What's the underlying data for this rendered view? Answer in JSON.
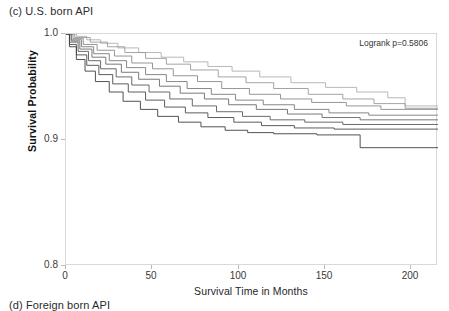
{
  "panel": {
    "title": "(c) U.S. born API",
    "next_panel_title": "(d) Foreign born API"
  },
  "chart_data": {
    "type": "line",
    "subtype": "kaplan-meier-step",
    "title": "(c) U.S. born API",
    "xlabel": "Survival Time in Months",
    "ylabel": "Survival Probability",
    "xlim": [
      0,
      215
    ],
    "ylim": [
      0.8,
      1.0
    ],
    "xticks": [
      0,
      50,
      100,
      150,
      200
    ],
    "xtick_labels": [
      "0",
      "50",
      "100",
      "150",
      "200"
    ],
    "yticks": [
      0.8,
      0.9,
      1.0
    ],
    "ytick_labels": [
      "0.8",
      "0.9",
      "1.0"
    ],
    "grid": false,
    "legend": "none",
    "annotations": [
      {
        "name": "logrank-annotation",
        "text": "Logrank p=0.5806",
        "position": "top-right"
      }
    ],
    "series": [
      {
        "name": "stage-group-1",
        "color": "#b0b0b0",
        "points": [
          [
            0,
            1.0
          ],
          [
            6,
            0.998
          ],
          [
            12,
            0.995
          ],
          [
            20,
            0.992
          ],
          [
            30,
            0.988
          ],
          [
            42,
            0.984
          ],
          [
            55,
            0.98
          ],
          [
            68,
            0.976
          ],
          [
            82,
            0.972
          ],
          [
            96,
            0.968
          ],
          [
            112,
            0.963
          ],
          [
            130,
            0.958
          ],
          [
            150,
            0.954
          ],
          [
            168,
            0.95
          ],
          [
            186,
            0.945
          ],
          [
            196,
            0.938
          ],
          [
            205,
            0.938
          ],
          [
            215,
            0.938
          ]
        ]
      },
      {
        "name": "stage-group-2",
        "color": "#9a9a9a",
        "points": [
          [
            0,
            1.0
          ],
          [
            5,
            0.997
          ],
          [
            14,
            0.993
          ],
          [
            24,
            0.989
          ],
          [
            34,
            0.984
          ],
          [
            46,
            0.979
          ],
          [
            58,
            0.974
          ],
          [
            72,
            0.969
          ],
          [
            88,
            0.963
          ],
          [
            104,
            0.958
          ],
          [
            120,
            0.953
          ],
          [
            140,
            0.948
          ],
          [
            160,
            0.944
          ],
          [
            178,
            0.94
          ],
          [
            196,
            0.936
          ],
          [
            215,
            0.936
          ]
        ]
      },
      {
        "name": "stage-group-3",
        "color": "#8a8a8a",
        "points": [
          [
            0,
            1.0
          ],
          [
            4,
            0.996
          ],
          [
            10,
            0.991
          ],
          [
            18,
            0.986
          ],
          [
            28,
            0.981
          ],
          [
            38,
            0.975
          ],
          [
            50,
            0.97
          ],
          [
            62,
            0.964
          ],
          [
            76,
            0.959
          ],
          [
            90,
            0.953
          ],
          [
            106,
            0.948
          ],
          [
            124,
            0.944
          ],
          [
            142,
            0.941
          ],
          [
            162,
            0.938
          ],
          [
            182,
            0.935
          ],
          [
            215,
            0.935
          ]
        ]
      },
      {
        "name": "stage-group-4",
        "color": "#7a7a7a",
        "points": [
          [
            0,
            1.0
          ],
          [
            3,
            0.995
          ],
          [
            9,
            0.989
          ],
          [
            16,
            0.983
          ],
          [
            25,
            0.977
          ],
          [
            35,
            0.971
          ],
          [
            46,
            0.965
          ],
          [
            58,
            0.959
          ],
          [
            70,
            0.953
          ],
          [
            84,
            0.948
          ],
          [
            98,
            0.943
          ],
          [
            114,
            0.939
          ],
          [
            132,
            0.935
          ],
          [
            152,
            0.932
          ],
          [
            175,
            0.93
          ],
          [
            215,
            0.93
          ]
        ]
      },
      {
        "name": "stage-group-5",
        "color": "#6a6a6a",
        "points": [
          [
            0,
            1.0
          ],
          [
            3,
            0.994
          ],
          [
            8,
            0.987
          ],
          [
            15,
            0.98
          ],
          [
            23,
            0.974
          ],
          [
            32,
            0.967
          ],
          [
            42,
            0.961
          ],
          [
            54,
            0.955
          ],
          [
            66,
            0.949
          ],
          [
            80,
            0.944
          ],
          [
            94,
            0.939
          ],
          [
            110,
            0.935
          ],
          [
            128,
            0.931
          ],
          [
            148,
            0.928
          ],
          [
            170,
            0.926
          ],
          [
            215,
            0.926
          ]
        ]
      },
      {
        "name": "stage-group-6",
        "color": "#5a5a5a",
        "points": [
          [
            0,
            1.0
          ],
          [
            2,
            0.993
          ],
          [
            7,
            0.985
          ],
          [
            13,
            0.977
          ],
          [
            20,
            0.97
          ],
          [
            29,
            0.963
          ],
          [
            38,
            0.956
          ],
          [
            48,
            0.95
          ],
          [
            60,
            0.944
          ],
          [
            73,
            0.938
          ],
          [
            87,
            0.933
          ],
          [
            102,
            0.929
          ],
          [
            118,
            0.926
          ],
          [
            138,
            0.924
          ],
          [
            160,
            0.922
          ],
          [
            215,
            0.922
          ]
        ]
      },
      {
        "name": "stage-group-7",
        "color": "#4a4a4a",
        "points": [
          [
            0,
            1.0
          ],
          [
            2,
            0.991
          ],
          [
            6,
            0.982
          ],
          [
            12,
            0.973
          ],
          [
            19,
            0.965
          ],
          [
            27,
            0.957
          ],
          [
            36,
            0.95
          ],
          [
            46,
            0.943
          ],
          [
            57,
            0.937
          ],
          [
            69,
            0.932
          ],
          [
            82,
            0.928
          ],
          [
            97,
            0.924
          ],
          [
            113,
            0.921
          ],
          [
            132,
            0.919
          ],
          [
            155,
            0.918
          ],
          [
            215,
            0.918
          ]
        ]
      },
      {
        "name": "stage-group-8",
        "color": "#404040",
        "points": [
          [
            0,
            1.0
          ],
          [
            2,
            0.989
          ],
          [
            6,
            0.978
          ],
          [
            11,
            0.968
          ],
          [
            17,
            0.959
          ],
          [
            25,
            0.95
          ],
          [
            33,
            0.942
          ],
          [
            43,
            0.935
          ],
          [
            53,
            0.929
          ],
          [
            65,
            0.924
          ],
          [
            78,
            0.92
          ],
          [
            92,
            0.917
          ],
          [
            105,
            0.915
          ],
          [
            120,
            0.914
          ],
          [
            145,
            0.913
          ],
          [
            170,
            0.902
          ],
          [
            215,
            0.902
          ]
        ]
      }
    ]
  }
}
